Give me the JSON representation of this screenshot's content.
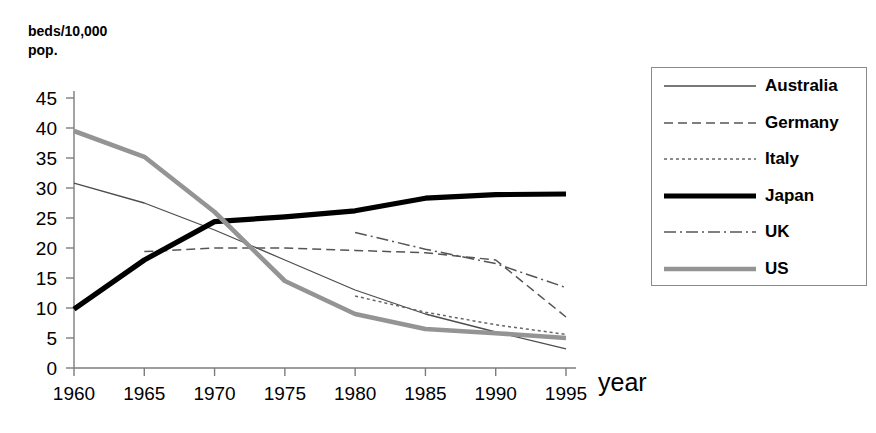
{
  "chart_data": {
    "type": "line",
    "title": "",
    "ylabel": "beds/10,000\npop.",
    "xlabel": "year",
    "x": [
      1960,
      1965,
      1970,
      1975,
      1980,
      1985,
      1990,
      1995
    ],
    "categories": [
      "1960",
      "1965",
      "1970",
      "1975",
      "1980",
      "1985",
      "1990",
      "1995"
    ],
    "xlim": [
      1960,
      1995
    ],
    "ylim": [
      0,
      45
    ],
    "yticks": [
      0,
      5,
      10,
      15,
      20,
      25,
      30,
      35,
      40,
      45
    ],
    "grid": false,
    "legend_position": "right",
    "series": [
      {
        "name": "Australia",
        "style": "solid-thin",
        "color": "#4d4d4d",
        "width": 1.3,
        "dash": "none",
        "x": [
          1960,
          1965,
          1970,
          1975,
          1980,
          1985,
          1990,
          1995
        ],
        "values": [
          30.8,
          27.5,
          23.0,
          18.0,
          13.0,
          9.0,
          6.0,
          3.2
        ]
      },
      {
        "name": "Germany",
        "style": "dashed",
        "color": "#555555",
        "width": 1.5,
        "dash": "9,5",
        "x": [
          1965,
          1970,
          1975,
          1980,
          1985,
          1990,
          1995
        ],
        "values": [
          19.4,
          20.0,
          20.0,
          19.6,
          19.2,
          18.0,
          8.5
        ]
      },
      {
        "name": "Italy",
        "style": "dotted",
        "color": "#666666",
        "width": 1.5,
        "dash": "3,3",
        "x": [
          1980,
          1985,
          1990,
          1995
        ],
        "values": [
          12.0,
          9.3,
          7.2,
          5.6
        ]
      },
      {
        "name": "Japan",
        "style": "solid-thick",
        "color": "#000000",
        "width": 5.2,
        "dash": "none",
        "x": [
          1960,
          1965,
          1970,
          1975,
          1980,
          1985,
          1990,
          1995
        ],
        "values": [
          9.8,
          18.0,
          24.4,
          25.2,
          26.2,
          28.3,
          28.9,
          29.0
        ]
      },
      {
        "name": "UK",
        "style": "dash-dot",
        "color": "#555555",
        "width": 1.5,
        "dash": "12,4,2,4",
        "x": [
          1980,
          1985,
          1990,
          1995
        ],
        "values": [
          22.6,
          19.8,
          17.4,
          13.4
        ]
      },
      {
        "name": "US",
        "style": "solid-thick-gray",
        "color": "#949494",
        "width": 4.6,
        "dash": "none",
        "x": [
          1960,
          1965,
          1970,
          1975,
          1980,
          1985,
          1990,
          1995
        ],
        "values": [
          39.5,
          35.2,
          26.0,
          14.5,
          9.0,
          6.5,
          5.8,
          5.0
        ]
      }
    ]
  },
  "legend": {
    "items": [
      {
        "label": "Australia"
      },
      {
        "label": "Germany"
      },
      {
        "label": "Italy"
      },
      {
        "label": "Japan"
      },
      {
        "label": "UK"
      },
      {
        "label": "US"
      }
    ]
  },
  "axes": {
    "y_title": "beds/10,000\npop.",
    "x_title": "year"
  }
}
